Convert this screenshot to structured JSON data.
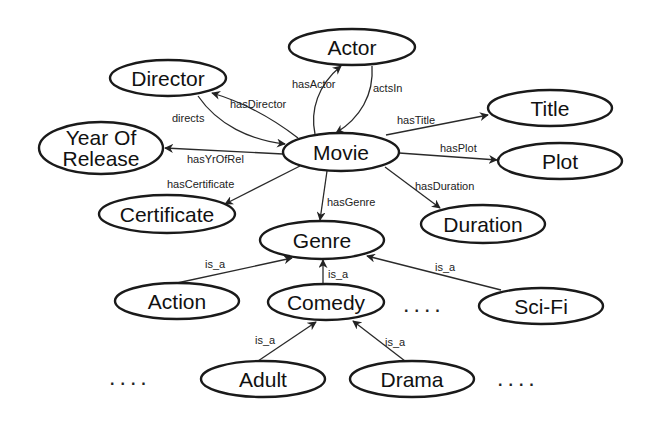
{
  "diagram": {
    "type": "ontology-graph",
    "nodes": {
      "actor": "Actor",
      "director": "Director",
      "title": "Title",
      "year_line1": "Year Of",
      "year_line2": "Release",
      "movie": "Movie",
      "plot": "Plot",
      "certificate": "Certificate",
      "duration": "Duration",
      "genre": "Genre",
      "action": "Action",
      "comedy": "Comedy",
      "scifi": "Sci-Fi",
      "adult": "Adult",
      "drama": "Drama"
    },
    "edges": {
      "has_actor": "hasActor",
      "acts_in": "actsIn",
      "has_director": "hasDirector",
      "directs": "directs",
      "has_title": "hasTitle",
      "has_yr_of_rel": "hasYrOfRel",
      "has_plot": "hasPlot",
      "has_certificate": "hasCertificate",
      "has_duration": "hasDuration",
      "has_genre": "hasGenre",
      "action_is_a": "is_a",
      "comedy_is_a": "is_a",
      "scifi_is_a": "is_a",
      "adult_is_a": "is_a",
      "drama_is_a": "is_a"
    },
    "ellipsis": {
      "middle": "....",
      "bottom_left": "....",
      "bottom_right": "...."
    },
    "colors": {
      "stroke": "#1a1a1a",
      "background": "#ffffff",
      "text": "#111111"
    }
  }
}
